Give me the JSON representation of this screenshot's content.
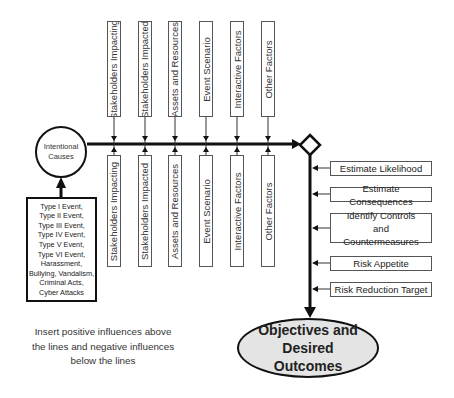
{
  "diagram": {
    "source_node": {
      "label": "Intentional Causes"
    },
    "cause_list": {
      "items": [
        "Type I Event,",
        "Type II Event,",
        "Type III Event,",
        "Type IV Event,",
        "Type V Event,",
        "Type VI Event,",
        "Harassment,",
        "Bullying, Vandalism,",
        "Criminal Acts,",
        "Cyber Attacks"
      ]
    },
    "positive_factors": [
      "Stakeholders Impacting",
      "Stakeholders Impacted",
      "Assets and Resources",
      "Event Scenario",
      "Interactive Factors",
      "Other Factors"
    ],
    "negative_factors": [
      "Stakeholders Impacting",
      "Stakeholders Impacted",
      "Assets and Resources",
      "Event Scenario",
      "Interactive Factors",
      "Other Factors"
    ],
    "assessment_steps": [
      "Estimate Likelihood",
      "Estimate Consequences",
      "Identify Controls and Countermeasures",
      "Risk Appetite",
      "Risk Reduction Target"
    ],
    "outcome_node": {
      "label": "Objectives and Desired Outcomes"
    },
    "note": "Insert positive influences above the lines and negative influences below the lines",
    "colors": {
      "line": "#111111",
      "box_border": "#555555",
      "outcome_fill": "#e4e4e4"
    }
  }
}
